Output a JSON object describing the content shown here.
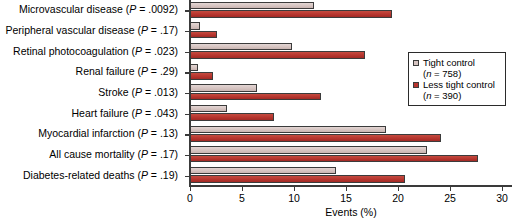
{
  "chart_data": {
    "type": "bar",
    "orientation": "horizontal",
    "title": "",
    "xlabel": "Events (%)",
    "ylabel": "",
    "xlim": [
      0,
      30
    ],
    "xticks": [
      0,
      5,
      10,
      15,
      20,
      25,
      30
    ],
    "grid": false,
    "legend_position": "right",
    "categories": [
      "Microvascular disease (P = .0092)",
      "Peripheral vascular disease (P = .17)",
      "Retinal photocoagulation (P = .023)",
      "Renal failure (P = .29)",
      "Stroke (P = .013)",
      "Heart failure (P = .043)",
      "Myocardial infarction (P = .13)",
      "All cause mortality (P = .17)",
      "Diabetes-related deaths (P = .19)"
    ],
    "category_parts": [
      {
        "name": "Microvascular disease",
        "p": ".0092"
      },
      {
        "name": "Peripheral vascular disease",
        "p": ".17"
      },
      {
        "name": "Retinal photocoagulation",
        "p": ".023"
      },
      {
        "name": "Renal failure",
        "p": ".29"
      },
      {
        "name": "Stroke",
        "p": ".013"
      },
      {
        "name": "Heart failure",
        "p": ".043"
      },
      {
        "name": "Myocardial infarction",
        "p": ".13"
      },
      {
        "name": "All cause mortality",
        "p": ".17"
      },
      {
        "name": "Diabetes-related deaths",
        "p": ".19"
      }
    ],
    "series": [
      {
        "name": "Tight control",
        "n": 758,
        "color": "#d6c4c1",
        "values": [
          11.9,
          1.0,
          9.8,
          0.8,
          6.4,
          3.6,
          18.8,
          22.8,
          14.0
        ]
      },
      {
        "name": "Less tight control",
        "n": 390,
        "color": "#b7352e",
        "values": [
          19.4,
          2.6,
          16.8,
          2.2,
          12.6,
          8.1,
          24.1,
          27.7,
          20.7
        ]
      }
    ]
  },
  "legend": {
    "items": [
      {
        "label": "Tight control",
        "sub": "(n = 758)",
        "n_prefix": "(",
        "n_symbol": "n",
        "n_value": " = 758)"
      },
      {
        "label": "Less tight control",
        "sub": "(n = 390)",
        "n_prefix": "(",
        "n_symbol": "n",
        "n_value": " = 390)"
      }
    ]
  },
  "axis": {
    "x_title": "Events (%)",
    "tick_labels": [
      "0",
      "5",
      "10",
      "15",
      "20",
      "25",
      "30"
    ]
  },
  "colors": {
    "tight_control": "#d6c4c1",
    "less_tight_control": "#b7352e",
    "axis": "#3a3a3a",
    "bar_border": "#3b3b3b",
    "background": "#ffffff"
  }
}
